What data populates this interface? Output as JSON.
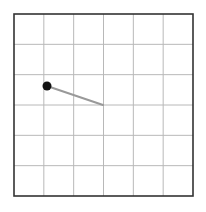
{
  "canvas": {
    "width": 206,
    "height": 212,
    "background": "#ffffff"
  },
  "grid": {
    "left": 14,
    "top": 14,
    "right": 193,
    "bottom": 196,
    "cols": 6,
    "rows": 6,
    "border_color": "#333333",
    "line_color": "#b8b8b8"
  },
  "dial": {
    "center": {
      "x": 103,
      "y": 105
    },
    "knob": {
      "x": 47,
      "y": 86,
      "r": 4.5,
      "color": "#111111"
    },
    "hand_color": "#999999"
  }
}
